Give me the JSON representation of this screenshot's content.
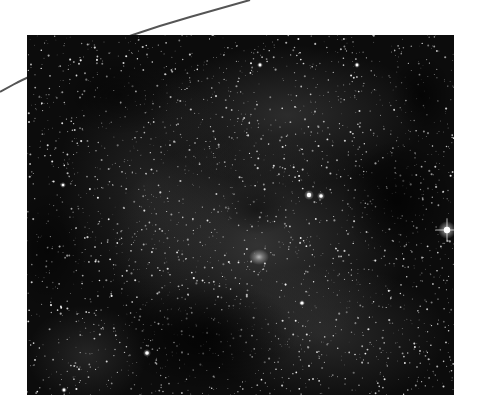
{
  "scene": {
    "subject": "Milky Way starfield photograph",
    "background_color": "#ffffff",
    "photo": {
      "x": 27,
      "y": 35,
      "width": 427,
      "height": 360,
      "base_color": "#0c0c0c"
    },
    "arc": {
      "color": "#555555",
      "width": 2,
      "points": [
        [
          0,
          92
        ],
        [
          27,
          77
        ],
        [
          130,
          34
        ],
        [
          250,
          0
        ]
      ]
    },
    "nebulosity": [
      {
        "cx": 230,
        "cy": 210,
        "rx": 150,
        "ry": 110,
        "opacity": 0.22
      },
      {
        "cx": 260,
        "cy": 80,
        "rx": 140,
        "ry": 70,
        "opacity": 0.18
      },
      {
        "cx": 120,
        "cy": 150,
        "rx": 90,
        "ry": 120,
        "opacity": 0.12
      },
      {
        "cx": 300,
        "cy": 300,
        "rx": 120,
        "ry": 70,
        "opacity": 0.16
      },
      {
        "cx": 60,
        "cy": 320,
        "rx": 60,
        "ry": 50,
        "opacity": 0.14
      }
    ],
    "dark_lanes": [
      {
        "cx": 180,
        "cy": 300,
        "rx": 90,
        "ry": 55,
        "opacity": 0.75
      },
      {
        "cx": 370,
        "cy": 165,
        "rx": 55,
        "ry": 60,
        "opacity": 0.7
      },
      {
        "cx": 395,
        "cy": 60,
        "rx": 30,
        "ry": 40,
        "opacity": 0.6
      },
      {
        "cx": 90,
        "cy": 60,
        "rx": 60,
        "ry": 40,
        "opacity": 0.45
      },
      {
        "cx": 20,
        "cy": 215,
        "rx": 40,
        "ry": 60,
        "opacity": 0.5
      },
      {
        "cx": 230,
        "cy": 175,
        "rx": 35,
        "ry": 25,
        "opacity": 0.4
      }
    ],
    "starfield": {
      "seed": 1337,
      "count": 2600,
      "min_radius": 0.35,
      "max_radius": 1.1,
      "min_opacity": 0.35,
      "max_opacity": 0.95
    },
    "bright_stars": [
      {
        "name": "bright-star-right-edge",
        "x": 420,
        "y": 195,
        "r": 3.2,
        "glow": 9
      },
      {
        "name": "bright-star-pair-a",
        "x": 282,
        "y": 160,
        "r": 2.2,
        "glow": 5
      },
      {
        "name": "bright-star-pair-b",
        "x": 294,
        "y": 161,
        "r": 1.8,
        "glow": 4
      },
      {
        "name": "bright-star-lower-left",
        "x": 120,
        "y": 318,
        "r": 1.8,
        "glow": 4
      },
      {
        "name": "bright-star-lower-right",
        "x": 275,
        "y": 268,
        "r": 1.6,
        "glow": 3
      },
      {
        "name": "bright-star-upper-mid",
        "x": 233,
        "y": 30,
        "r": 1.4,
        "glow": 3
      },
      {
        "name": "bright-star-upper-right",
        "x": 330,
        "y": 30,
        "r": 1.4,
        "glow": 3
      },
      {
        "name": "bright-star-left",
        "x": 36,
        "y": 150,
        "r": 1.3,
        "glow": 3
      },
      {
        "name": "bright-star-bottom",
        "x": 37,
        "y": 355,
        "r": 1.4,
        "glow": 3
      }
    ],
    "nebula_core": {
      "name": "central-nebula-patch",
      "x": 232,
      "y": 222,
      "rx": 10,
      "ry": 8,
      "opacity": 0.65
    }
  }
}
